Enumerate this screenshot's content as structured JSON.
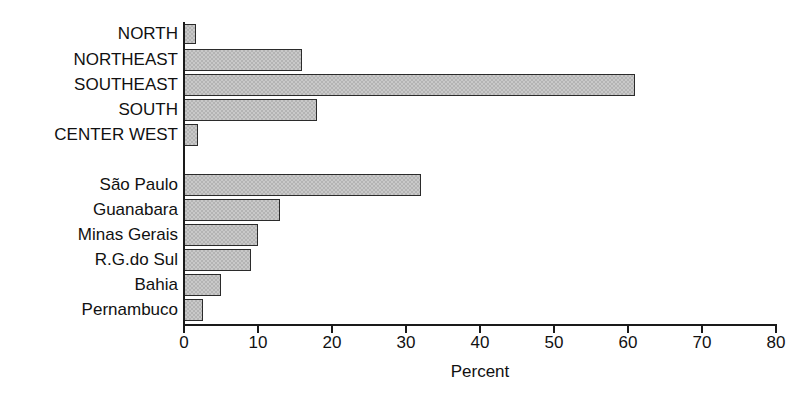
{
  "chart_data": {
    "type": "bar",
    "orientation": "horizontal",
    "title": "",
    "xlabel": "Percent",
    "ylabel": "",
    "xlim": [
      0,
      80
    ],
    "xticks": [
      0,
      10,
      20,
      30,
      40,
      50,
      60,
      70,
      80
    ],
    "xtick_labels": [
      "0",
      "10",
      "20",
      "30",
      "40",
      "50",
      "60",
      "70",
      "80"
    ],
    "grid": false,
    "legend": false,
    "bar_fill_color": "#c9c9c9",
    "bar_edge_color": "#2b2b2b",
    "axis_color": "#1a1a1a",
    "groups": [
      {
        "name": "regions",
        "categories": [
          "NORTH",
          "NORTHEAST",
          "SOUTHEAST",
          "SOUTH",
          "CENTER WEST"
        ],
        "values": [
          1.6,
          16.0,
          61.0,
          18.0,
          1.9
        ]
      },
      {
        "name": "states",
        "categories": [
          "São Paulo",
          "Guanabara",
          "Minas Gerais",
          "R.G.do Sul",
          "Bahia",
          "Pernambuco"
        ],
        "values": [
          32.0,
          13.0,
          10.0,
          9.0,
          5.0,
          2.6
        ]
      }
    ],
    "categories": [
      "NORTH",
      "NORTHEAST",
      "SOUTHEAST",
      "SOUTH",
      "CENTER WEST",
      "São Paulo",
      "Guanabara",
      "Minas Gerais",
      "R.G.do Sul",
      "Bahia",
      "Pernambuco"
    ],
    "values": [
      1.6,
      16.0,
      61.0,
      18.0,
      1.9,
      32.0,
      13.0,
      10.0,
      9.0,
      5.0,
      2.6
    ]
  },
  "bars": [
    {
      "label": "NORTH",
      "value": 1.6,
      "top": 24,
      "height": 20
    },
    {
      "label": "NORTHEAST",
      "value": 16.0,
      "top": 49,
      "height": 22
    },
    {
      "label": "SOUTHEAST",
      "value": 61.0,
      "top": 74,
      "height": 22
    },
    {
      "label": "SOUTH",
      "value": 18.0,
      "top": 99,
      "height": 22
    },
    {
      "label": "CENTER WEST",
      "value": 1.9,
      "top": 124,
      "height": 22
    },
    {
      "label": "São Paulo",
      "value": 32.0,
      "top": 174,
      "height": 22
    },
    {
      "label": "Guanabara",
      "value": 13.0,
      "top": 199,
      "height": 22
    },
    {
      "label": "Minas Gerais",
      "value": 10.0,
      "top": 224,
      "height": 22
    },
    {
      "label": "R.G.do Sul",
      "value": 9.0,
      "top": 249,
      "height": 22
    },
    {
      "label": "Bahia",
      "value": 5.0,
      "top": 274,
      "height": 22
    },
    {
      "label": "Pernambuco",
      "value": 2.6,
      "top": 299,
      "height": 22
    }
  ]
}
